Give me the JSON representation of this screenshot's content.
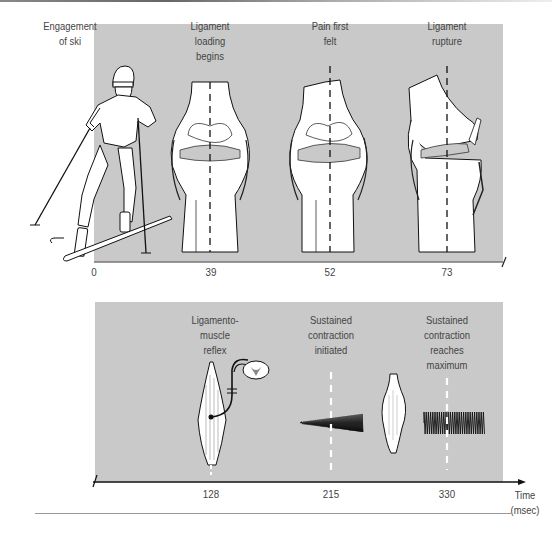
{
  "figure": {
    "panel_top": {
      "background": "#c9c9c9",
      "events": [
        {
          "label_lines": [
            "Engagement",
            "of ski"
          ],
          "time": "0",
          "illustration": "skier-icon"
        },
        {
          "label_lines": [
            "Ligament",
            "loading",
            "begins"
          ],
          "time": "39",
          "illustration": "knee-normal-icon"
        },
        {
          "label_lines": [
            "Pain first",
            "felt"
          ],
          "time": "52",
          "illustration": "knee-stressed-icon"
        },
        {
          "label_lines": [
            "Ligament",
            "rupture"
          ],
          "time": "73",
          "illustration": "knee-ruptured-icon"
        }
      ]
    },
    "panel_bottom": {
      "background": "#c9c9c9",
      "events": [
        {
          "label_lines": [
            "Ligamento-",
            "muscle",
            "reflex"
          ],
          "time": "128",
          "illustration": "muscle-spinal-cord-reflex-icon"
        },
        {
          "label_lines": [
            "Sustained",
            "contraction",
            "initiated"
          ],
          "time": "215",
          "illustration": "emg-ramp-icon"
        },
        {
          "label_lines": [
            "Sustained",
            "contraction",
            "reaches",
            "maximum"
          ],
          "time": "330",
          "illustration": "emg-max-icon"
        }
      ],
      "axis": {
        "label_lines": [
          "Time",
          "(msec)"
        ]
      }
    }
  }
}
